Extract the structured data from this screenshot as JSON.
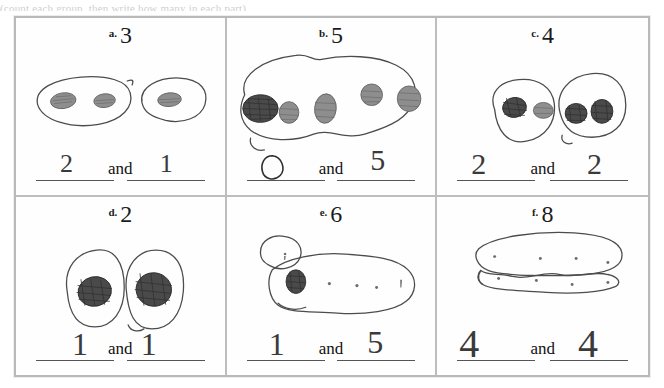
{
  "scan": {
    "top_cut_text": "(count each group, then write how many in each part)",
    "width_px": 664,
    "height_px": 388,
    "ink_color": "#4c4c4c",
    "frame_color": "#bdbdbd",
    "paper_color": "#fefefe"
  },
  "worksheet": {
    "columns": 3,
    "rows": 2,
    "conjunction": "and",
    "cells": [
      {
        "id": "a",
        "letter": "a.",
        "total": "3",
        "groups": [
          {
            "shape": "oval",
            "dot_count": 2
          },
          {
            "shape": "oval",
            "dot_count": 1
          }
        ],
        "answer_left": "2",
        "answer_right": "1",
        "answer_left_written": true,
        "answer_right_written": true
      },
      {
        "id": "b",
        "letter": "b.",
        "total": "5",
        "groups": [
          {
            "shape": "large-blob",
            "dot_count": 5
          }
        ],
        "answer_left": "0",
        "answer_right": "5",
        "answer_left_written": true,
        "answer_right_written": true
      },
      {
        "id": "c",
        "letter": "c.",
        "total": "4",
        "groups": [
          {
            "shape": "oval",
            "dot_count": 2
          },
          {
            "shape": "oval",
            "dot_count": 2
          }
        ],
        "answer_left": "2",
        "answer_right": "2",
        "answer_left_written": true,
        "answer_right_written": true
      },
      {
        "id": "d",
        "letter": "d.",
        "total": "2",
        "groups": [
          {
            "shape": "oval",
            "dot_count": 1
          },
          {
            "shape": "oval",
            "dot_count": 1
          }
        ],
        "answer_left": "1",
        "answer_right": "1",
        "answer_left_written": true,
        "answer_right_written": true
      },
      {
        "id": "e",
        "letter": "e.",
        "total": "6",
        "groups": [
          {
            "shape": "small-circle",
            "dot_count": 1
          },
          {
            "shape": "large-blob",
            "dot_count": 5
          }
        ],
        "answer_left": "1",
        "answer_right": "5",
        "answer_left_written": true,
        "answer_right_written": true
      },
      {
        "id": "f",
        "letter": "f.",
        "total": "8",
        "groups": [
          {
            "shape": "long-blob",
            "dot_count": 4
          },
          {
            "shape": "long-blob",
            "dot_count": 4
          }
        ],
        "answer_left": "4",
        "answer_right": "4",
        "answer_left_written": true,
        "answer_right_written": true
      }
    ]
  }
}
